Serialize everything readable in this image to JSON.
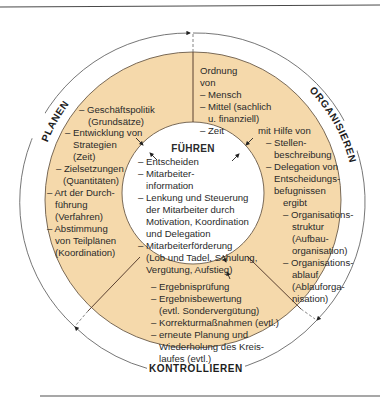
{
  "colors": {
    "ring_fill": "#f5d9ab",
    "ring_stroke": "#5a4a3a",
    "inner_fill": "#ffffff",
    "cycle_line": "#666666",
    "rule_top": "#555555",
    "rule_bottom": "#888888"
  },
  "cycle_labels": {
    "planen": "PLANEN",
    "organisieren": "ORGANISIEREN",
    "kontrollieren": "KONTROLLIEREN"
  },
  "center": {
    "title": "FÜHREN",
    "lines": [
      "– Entscheiden",
      "– Mitarbeiter-",
      "information",
      "– Lenkung und Steuerung",
      "der Mitarbeiter durch",
      "Motivation, Koordination",
      "und Delegation",
      "– Mitarbeiterförderung",
      "(Lob und Tadel, Schulung,",
      "Vergütung, Aufstieg)"
    ]
  },
  "planen_segment": {
    "lines": [
      "– Geschäftspolitik",
      "(Grundsätze)",
      "– Entwicklung von",
      "Strategien",
      "(Zeit)",
      "– Zielsetzungen",
      "(Quantitäten)",
      "– Art der Durch-",
      "führung",
      "(Verfahren)",
      "– Abstimmung",
      "von Teilplänen",
      "(Koordination)"
    ]
  },
  "organisieren_segment": {
    "top_lines": [
      "Ordnung",
      "von",
      "– Mensch",
      "– Mittel (sachlich",
      "u. finanziell)",
      "– Zeit"
    ],
    "right_lines": [
      "mit Hilfe von",
      "– Stellen-",
      "beschreibung",
      "– Delegation von",
      "Entscheidungs-",
      "befugnissen",
      "ergibt",
      "– Organisations-",
      "struktur",
      "(Aufbau-",
      "organisation)",
      "– Organisations-",
      "ablauf",
      "(Ablauforga-",
      "nisation)"
    ]
  },
  "kontrollieren_segment": {
    "lines": [
      "– Ergebnisprüfung",
      "– Ergebnisbewertung",
      "(evtl. Sondervergütung)",
      "– Korrekturmaßnahmen (evtl.)",
      "– erneute Planung und",
      "Wiederholung des Kreis-",
      "laufes (evtl.)"
    ]
  }
}
